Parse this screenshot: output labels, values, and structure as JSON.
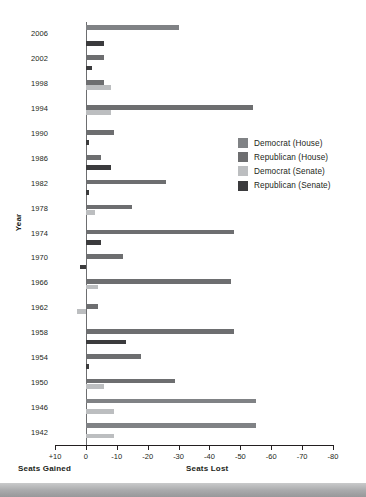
{
  "chart_data": {
    "type": "bar",
    "orientation": "horizontal",
    "title": "",
    "xlabel": "",
    "ylabel": "Year",
    "axis_captions": {
      "left": "Seats Gained",
      "right": "Seats Lost"
    },
    "xlim": [
      10,
      -80
    ],
    "xticks": [
      10,
      0,
      -10,
      -20,
      -30,
      -40,
      -50,
      -60,
      -70,
      -80
    ],
    "xticklabels": [
      "+10",
      "0",
      "-10",
      "-20",
      "-30",
      "-40",
      "-50",
      "-60",
      "-70",
      "-80"
    ],
    "grid": false,
    "legend_position": "right",
    "categories": [
      "2006",
      "2002",
      "1998",
      "1994",
      "1990",
      "1986",
      "1982",
      "1978",
      "1974",
      "1970",
      "1966",
      "1962",
      "1958",
      "1954",
      "1950",
      "1946",
      "1942"
    ],
    "series": [
      {
        "name": "Democrat (House)",
        "color": "#808285",
        "values": [
          -30,
          0,
          0,
          0,
          0,
          0,
          0,
          0,
          0,
          0,
          0,
          0,
          0,
          0,
          0,
          -55,
          -55
        ]
      },
      {
        "name": "Republican (House)",
        "color": "#6d6e70",
        "values": [
          0,
          -6,
          -6,
          -54,
          -9,
          -5,
          -26,
          -15,
          -48,
          -12,
          -47,
          -4,
          -48,
          -18,
          -29,
          0,
          0
        ]
      },
      {
        "name": "Democrat (Senate)",
        "color": "#bcbec0",
        "values": [
          0,
          0,
          -8,
          -8,
          0,
          0,
          0,
          -3,
          0,
          0,
          -4,
          3,
          0,
          0,
          -6,
          -9,
          -9
        ]
      },
      {
        "name": "Republican (Senate)",
        "color": "#3b3b3d",
        "values": [
          -6,
          -2,
          0,
          0,
          -1,
          -8,
          -1,
          0,
          -5,
          2,
          0,
          0,
          -13,
          -1,
          0,
          0,
          0
        ]
      }
    ],
    "legend": [
      {
        "label": "Democrat (House)",
        "color": "#808285"
      },
      {
        "label": "Republican (House)",
        "color": "#6d6e70"
      },
      {
        "label": "Democrat (Senate)",
        "color": "#bcbec0"
      },
      {
        "label": "Republican (Senate)",
        "color": "#3b3b3d"
      }
    ]
  }
}
